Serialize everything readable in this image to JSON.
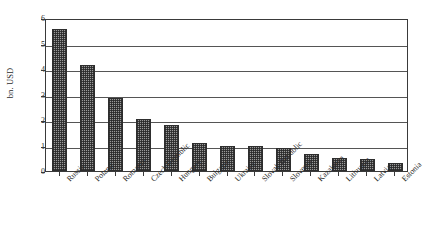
{
  "chart_data": {
    "type": "bar",
    "title": "",
    "subtitle": "",
    "xlabel": "",
    "ylabel": "bn. USD",
    "ylim": [
      0,
      6
    ],
    "ytick_labels": [
      "6",
      "5",
      "4",
      "3",
      "2",
      "1",
      "0"
    ],
    "ytick_values": [
      6,
      5,
      4,
      3,
      2,
      1,
      0
    ],
    "grid": true,
    "legend": null,
    "legend_position": "none",
    "categories": [
      "Russia",
      "Poland",
      "Romania",
      "Czech Republic",
      "Hungary",
      "Bulgaria",
      "Ukraine",
      "Slovak Republic",
      "Slovenia",
      "Kazakstan",
      "Lithuania",
      "Latvia",
      "Estonia"
    ],
    "values": [
      5.55,
      4.15,
      2.85,
      2.05,
      1.8,
      1.1,
      1.0,
      1.0,
      0.9,
      0.65,
      0.5,
      0.47,
      0.32
    ],
    "bar_color": "#9a9a9a",
    "bar_edge_color": "#2e2e2e",
    "bar_pattern": "fine-checker",
    "axis_color": "#3a3a3a",
    "gridline_color": "#555555",
    "background_color": "#ffffff"
  }
}
